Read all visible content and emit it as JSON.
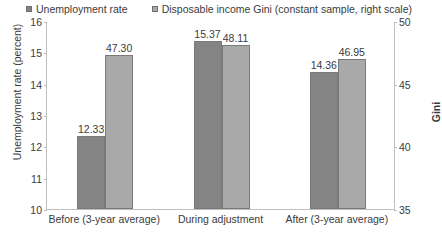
{
  "chart_data": {
    "type": "bar",
    "title": "",
    "categories": [
      "Before (3-year average)",
      "During adjustment",
      "After (3-year average)"
    ],
    "series": [
      {
        "name": "Unemployment rate",
        "axis": "left",
        "color": "#848484",
        "values": [
          12.33,
          15.37,
          14.36
        ],
        "labels": [
          "12.33",
          "15.37",
          "14.36"
        ]
      },
      {
        "name": "Disposable income Gini (constant sample, right scale)",
        "axis": "right",
        "color": "#a9a9a9",
        "values": [
          47.3,
          48.11,
          46.95
        ],
        "labels": [
          "47.30",
          "48.11",
          "46.95"
        ]
      }
    ],
    "xlabel": "",
    "ylabel": "Unemployment rate (percent)",
    "y2label": "Gini",
    "ylim": [
      10,
      16
    ],
    "yticks": [
      16,
      15,
      14,
      13,
      12,
      11,
      10
    ],
    "ytick_labels": [
      "16",
      "15",
      "14",
      "13",
      "12",
      "11",
      "10"
    ],
    "y2lim": [
      35,
      50
    ],
    "y2ticks": [
      50,
      45,
      40,
      35
    ],
    "y2tick_labels": [
      "50",
      "45",
      "40",
      "35"
    ],
    "grid": false,
    "legend_position": "top"
  },
  "legend": {
    "items": [
      {
        "label": "Unemployment rate",
        "swatch": "#848484"
      },
      {
        "label": "Disposable income Gini (constant sample, right scale)",
        "swatch": "#a9a9a9"
      }
    ]
  }
}
